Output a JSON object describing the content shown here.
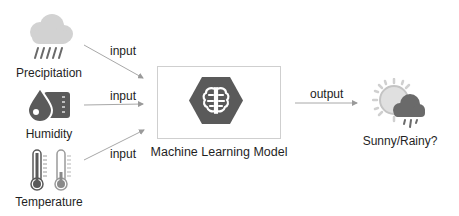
{
  "diagram": {
    "inputs": [
      {
        "id": "precipitation",
        "label": "Precipitation",
        "icon": "rain-cloud-icon",
        "arrow_label": "input"
      },
      {
        "id": "humidity",
        "label": "Humidity",
        "icon": "humidity-drop-icon",
        "arrow_label": "input"
      },
      {
        "id": "temperature",
        "label": "Temperature",
        "icon": "thermometer-icon",
        "arrow_label": "input"
      }
    ],
    "model": {
      "label": "Machine Learning Model",
      "icon": "brain-hexagon-icon"
    },
    "output": {
      "arrow_label": "output",
      "label": "Sunny/Rainy?",
      "icon": "sun-rain-cloud-icon"
    }
  },
  "colors": {
    "icon_dark": "#5a5a5a",
    "icon_light": "#c8c8c8",
    "arrow": "#9a9a9a",
    "box_border": "#cfcfcf",
    "text": "#1f1f1f"
  }
}
